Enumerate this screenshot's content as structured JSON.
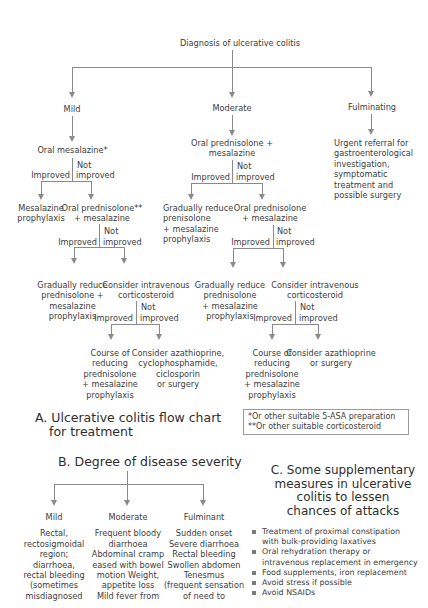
{
  "flowchart": {
    "root": "Diagnosis of ulcerative colitis",
    "branches": {
      "mild": "Mild",
      "moderate": "Moderate",
      "fulminating": "Fulminating"
    },
    "mild": {
      "step1": "Oral mesalazine*",
      "not": "Not",
      "improved": "Improved",
      "not_improved": "improved",
      "improved_outcome": [
        "Mesalazine",
        "prophylaxis"
      ],
      "not_improved_step": [
        "Oral prednisolone**",
        "+ mesalazine"
      ],
      "step2_not": "Not",
      "step2_improved": "Improved",
      "step2_not_improved": "improved",
      "step2_improved_outcome": [
        "Gradually reduce",
        "prednisolone +",
        "mesalazine",
        "prophylaxis"
      ],
      "step2_not_improved_step": [
        "Consider intravenous",
        "corticosteroid"
      ],
      "step3_not": "Not",
      "step3_improved": "Improved",
      "step3_not_improved": "improved",
      "step3_improved_outcome": [
        "Course of",
        "reducing",
        "prednisolone",
        "+ mesalazine",
        "prophylaxis"
      ],
      "step3_not_improved_outcome": [
        "Consider azathioprine,",
        "cyclophosphamide,",
        "ciclosporin",
        "or surgery"
      ]
    },
    "moderate": {
      "step1": [
        "Oral prednisolone +",
        "mesalazine"
      ],
      "not": "Not",
      "improved": "Improved",
      "not_improved": "improved",
      "improved_outcome": [
        "Gradually reduce",
        "prenisolone",
        "+ mesalazine",
        "prophylaxis"
      ],
      "not_improved_step": [
        "Oral prednisolone",
        "+ mesalazine"
      ],
      "step2_not": "Not",
      "step2_improved": "Improved",
      "step2_not_improved": "improved",
      "step2_improved_outcome": [
        "Gradually reduce",
        "prednisolone",
        "+ mesalazine",
        "prophylaxis"
      ],
      "step2_not_improved_step": [
        "Consider intravenous",
        "corticosteroid"
      ],
      "step3_not": "Not",
      "step3_improved": "Improved",
      "step3_not_improved": "improved",
      "step3_improved_outcome": [
        "Course of",
        "reducing",
        "prednisolone",
        "+ mesalazine",
        "prophylaxis"
      ],
      "step3_not_improved_outcome": [
        "Consider azathioprine",
        "or surgery"
      ]
    },
    "fulminating": {
      "step1": [
        "Urgent referral for",
        "gastroenterological",
        "investigation,",
        "symptomatic",
        "treatment and",
        "possible surgery"
      ]
    },
    "footnotes": [
      "*Or other suitable 5-ASA preparation",
      "**Or other suitable corticosteroid"
    ],
    "caption": [
      "A. Ulcerative colitis flow chart",
      "for treatment"
    ]
  },
  "severity": {
    "title": "B. Degree of disease severity",
    "columns": [
      {
        "label": "Mild",
        "lines": [
          "Rectal,",
          "rectosigmoidal",
          "region;",
          "diarrhoea,",
          "rectal bleeding",
          "(sometimes",
          "misdiagnosed"
        ]
      },
      {
        "label": "Moderate",
        "lines": [
          "Frequent bloody",
          "diarrhoea",
          "Abdominal cramp",
          "eased with bowel",
          "motion Weight,",
          "appetite loss",
          "Mild fever from"
        ]
      },
      {
        "label": "Fulminant",
        "lines": [
          "Sudden onset",
          "Severe diarrhoea",
          "Rectal bleeding",
          "Swollen abdomen",
          "Tenesmus",
          "(frequent sensation",
          "of need to"
        ]
      }
    ]
  },
  "supplementary": {
    "title": [
      "C. Some supplementary",
      "measures in ulcerative",
      "colitis to lessen",
      "chances of attacks"
    ],
    "items": [
      [
        "Treatment of proximal constipation",
        "with bulk-providing laxatives"
      ],
      [
        "Oral rehydration therapy or",
        "intravenous replacement in emergency"
      ],
      [
        "Food supplements, iron replacement"
      ],
      [
        "Avoid stress if possible"
      ],
      [
        "Avoid NSAIDs"
      ]
    ]
  },
  "colors": {
    "line": "#8a8a8a",
    "text": "#3c3c3c"
  }
}
